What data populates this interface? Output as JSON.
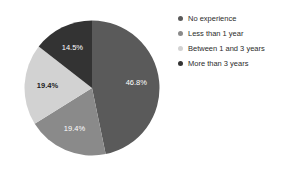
{
  "chart_data": {
    "type": "pie",
    "title": "",
    "categories": [
      "No experience",
      "Less than 1 year",
      "Between 1 and 3 years",
      "More than 3 years"
    ],
    "values": [
      46.8,
      19.4,
      19.4,
      14.5
    ],
    "value_labels": [
      "46.8%",
      "19.4%",
      "19.4%",
      "14.5%"
    ],
    "colors": [
      "#5a5a5a",
      "#8a8a8a",
      "#d2d2d2",
      "#333333"
    ],
    "label_text_colors": [
      "#ffffff",
      "#ffffff",
      "#1c1c1c",
      "#ffffff"
    ],
    "start_angle_deg": 0,
    "direction": "clockwise",
    "legend_position": "right",
    "grid": false,
    "xlabel": "",
    "ylabel": ""
  },
  "legend": {
    "items": [
      {
        "label": "No experience",
        "color": "#5a5a5a"
      },
      {
        "label": "Less than 1 year",
        "color": "#8a8a8a"
      },
      {
        "label": "Between 1 and 3 years",
        "color": "#d2d2d2"
      },
      {
        "label": "More than 3 years",
        "color": "#333333"
      }
    ]
  }
}
